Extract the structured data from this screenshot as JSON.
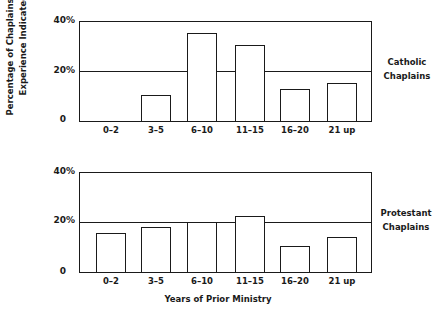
{
  "chart_data": [
    {
      "type": "bar",
      "title": "Catholic Chaplains",
      "categories": [
        "0–2",
        "3–5",
        "6–10",
        "11–15",
        "16–20",
        "21 up"
      ],
      "values": [
        0,
        10.5,
        35,
        30,
        12.5,
        15
      ],
      "reference_line": 20,
      "xlabel": "Years of Prior Ministry",
      "ylabel": "Percentage of Chaplains with Experience Indicated",
      "yticks": [
        "0",
        "20%",
        "40%"
      ],
      "ylim": [
        0,
        40
      ],
      "grid": false,
      "legend": "none"
    },
    {
      "type": "bar",
      "title": "Protestant Chaplains",
      "categories": [
        "0–2",
        "3–5",
        "6–10",
        "11–15",
        "16–20",
        "21 up"
      ],
      "values": [
        15.5,
        18,
        20,
        22,
        10.5,
        14
      ],
      "reference_line": 20,
      "xlabel": "Years of Prior Ministry",
      "ylabel": "Percentage of Chaplains with Experience Indicated",
      "yticks": [
        "0",
        "20%",
        "40%"
      ],
      "ylim": [
        0,
        40
      ],
      "grid": false,
      "legend": "none"
    }
  ],
  "labels": {
    "y_title_line1": "Percentage of Chaplains with",
    "y_title_line2": "Experience Indicated",
    "x_title": "Years of Prior Ministry",
    "top_panel_line1": "Catholic",
    "top_panel_line2": "Chaplains",
    "bottom_panel_line1": "Protestant",
    "bottom_panel_line2": "Chaplains",
    "ytick_0": "0",
    "ytick_20": "20%",
    "ytick_40": "40%"
  }
}
